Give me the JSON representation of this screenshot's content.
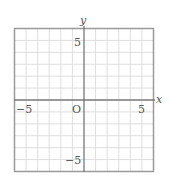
{
  "chart_data": {
    "type": "scatter",
    "title": "",
    "xlabel": "x",
    "ylabel": "y",
    "xlim": [
      -6,
      6
    ],
    "ylim": [
      -6,
      6
    ],
    "grid": true,
    "grid_step": 1,
    "x_tick_labels": [
      {
        "value": -5,
        "label": "−5"
      },
      {
        "value": 5,
        "label": "5"
      }
    ],
    "y_tick_labels": [
      {
        "value": 5,
        "label": "5"
      },
      {
        "value": -5,
        "label": "−5"
      }
    ],
    "origin_label": "O",
    "series": [],
    "legend": null
  },
  "labels": {
    "x_axis": "x",
    "y_axis": "y",
    "origin": "O",
    "x_neg5": "−5",
    "x_pos5": "5",
    "y_pos5": "5",
    "y_neg5": "−5"
  },
  "colors": {
    "grid": "#dedede",
    "border": "#9a9a9a",
    "axis": "#777777",
    "text": "#555555",
    "background": "#ffffff"
  }
}
